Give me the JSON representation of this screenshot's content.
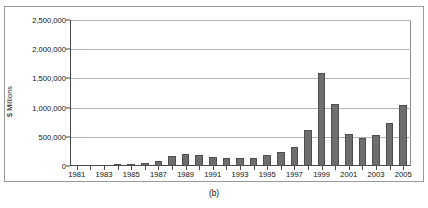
{
  "figure": {
    "caption": "(b)",
    "ylabel": "$ Millions"
  },
  "chart_data": {
    "type": "bar",
    "title": "",
    "xlabel": "",
    "ylabel": "$ Millions",
    "ylim": [
      0,
      2500000
    ],
    "ytick_labels": [
      "2,500,000",
      "2,000,000",
      "1,500,000",
      "1,000,000",
      "500,000",
      "0"
    ],
    "ytick_values": [
      2500000,
      2000000,
      1500000,
      1000000,
      500000,
      0
    ],
    "grid": true,
    "legend": "none",
    "bar_color": "#6e6e6e",
    "categories": [
      "1981",
      "1982",
      "1983",
      "1984",
      "1985",
      "1986",
      "1987",
      "1988",
      "1989",
      "1990",
      "1991",
      "1992",
      "1993",
      "1994",
      "1995",
      "1996",
      "1997",
      "1998",
      "1999",
      "2000",
      "2001",
      "2002",
      "2003",
      "2004",
      "2005"
    ],
    "xtick_labels": [
      "1981",
      "1983",
      "1985",
      "1987",
      "1989",
      "1991",
      "1993",
      "1995",
      "1997",
      "1999",
      "2001",
      "2003",
      "2005"
    ],
    "values": [
      0,
      0,
      0,
      5000,
      30000,
      55000,
      90000,
      170000,
      200000,
      185000,
      160000,
      130000,
      140000,
      135000,
      190000,
      235000,
      330000,
      610000,
      1600000,
      1060000,
      545000,
      475000,
      530000,
      740000,
      1045000
    ]
  }
}
